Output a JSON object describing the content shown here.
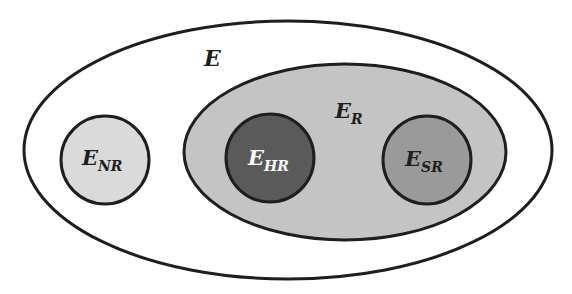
{
  "diagram": {
    "type": "nested-set-diagram",
    "colors": {
      "outline": "#1e1e1e",
      "background": "#ffffff",
      "universe_fill": "#ffffff",
      "reflective_fill": "#c4c4c4",
      "non_reflective_fill": "#dadada",
      "hard_reflective_fill": "#5a5a5a",
      "soft_reflective_fill": "#9a9a9a",
      "dark_text": "#1e1e1e",
      "light_text": "#ffffff"
    },
    "sets": {
      "universe": {
        "label_main": "E",
        "label_sub": "",
        "shape": "ellipse",
        "cx": 288,
        "cy": 150,
        "rx": 264,
        "ry": 129
      },
      "reflective": {
        "label_main": "E",
        "label_sub": "R",
        "shape": "ellipse",
        "cx": 345,
        "cy": 152,
        "rx": 161,
        "ry": 88,
        "parent": "universe"
      },
      "non_reflective": {
        "label_main": "E",
        "label_sub": "NR",
        "shape": "circle",
        "cx": 105,
        "cy": 160,
        "r": 44,
        "parent": "universe"
      },
      "hard_reflective": {
        "label_main": "E",
        "label_sub": "HR",
        "shape": "circle",
        "cx": 270,
        "cy": 158,
        "r": 44,
        "parent": "reflective"
      },
      "soft_reflective": {
        "label_main": "E",
        "label_sub": "SR",
        "shape": "circle",
        "cx": 427,
        "cy": 160,
        "r": 44,
        "parent": "reflective"
      }
    }
  }
}
